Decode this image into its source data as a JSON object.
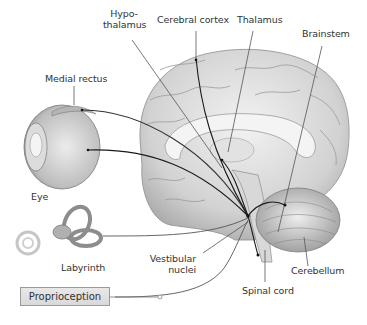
{
  "diagram": {
    "labels": {
      "hypothalamus": [
        "Hypo-",
        "thalamus"
      ],
      "cerebral_cortex": "Cerebral cortex",
      "thalamus": "Thalamus",
      "brainstem": "Brainstem",
      "medial_rectus": "Medial rectus",
      "eye": "Eye",
      "labyrinth": "Labyrinth",
      "vestibular_nuclei": [
        "Vestibular",
        "nuclei"
      ],
      "cerebellum": "Cerebellum",
      "spinal_cord": "Spinal cord",
      "proprioception": "Proprioception"
    },
    "colors": {
      "brain": "#d4d4d4",
      "brain_shadow": "#a8a8a8",
      "pathway": "#1a1a1a",
      "leader": "#555555",
      "box_fill": "#e0e0e0",
      "box_border": "#9a9a9a"
    }
  }
}
